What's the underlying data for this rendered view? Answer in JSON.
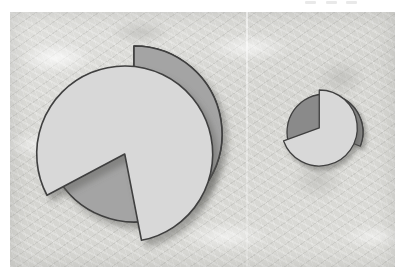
{
  "figure": {
    "title": "",
    "panel_count": 2,
    "background_texture": "mottled-paper-gray",
    "plate_color": "#d9d9d6"
  },
  "palette": {
    "slice_dark": "#8a8a8a",
    "slice_medium": "#a4a4a4",
    "slice_light": "#d8d8d8",
    "outline": "#3f3f3f",
    "shadow": "rgba(90,90,88,0.45)",
    "plate": "#d9d9d6",
    "page": "#ffffff"
  },
  "top_remnant": {
    "marks": [
      "",
      "",
      ""
    ]
  },
  "chart_data": [
    {
      "type": "pie",
      "name": "large-pie",
      "title": "",
      "xlabel": "",
      "ylabel": "",
      "center": [
        134,
        134
      ],
      "radius": 88,
      "start_angle_deg": 90,
      "direction": "clockwise",
      "legend": "none",
      "grid": false,
      "labels": [
        "Slice A",
        "Slice B",
        "Slice C"
      ],
      "values": [
        47,
        33,
        20
      ],
      "slices": [
        {
          "label": "Slice A",
          "value": 47,
          "percent": 47,
          "color": "#8a8a8a",
          "shade": "dark-gray",
          "start_deg": 90,
          "end_deg": -79,
          "exploded": false,
          "offset_px": 0
        },
        {
          "label": "Slice B",
          "value": 33,
          "percent": 33,
          "color": "#a4a4a4",
          "shade": "medium-gray",
          "start_deg": 90,
          "end_deg": 208,
          "exploded": false,
          "offset_px": 0
        },
        {
          "label": "Slice C",
          "value": 20,
          "percent": 20,
          "color": "#d8d8d8",
          "shade": "light-gray",
          "start_deg": 208,
          "end_deg": 281,
          "exploded": true,
          "offset_px": 22,
          "offset_direction_deg": 245
        }
      ]
    },
    {
      "type": "pie",
      "name": "small-pie",
      "title": "",
      "xlabel": "",
      "ylabel": "",
      "center": [
        325,
        132
      ],
      "radius": 38,
      "start_angle_deg": 90,
      "direction": "clockwise",
      "legend": "none",
      "grid": false,
      "labels": [
        "Slice A",
        "Slice B",
        "Slice C"
      ],
      "values": [
        42,
        36,
        22
      ],
      "slices": [
        {
          "label": "Slice A",
          "value": 42,
          "percent": 42,
          "color": "#8a8a8a",
          "shade": "dark-gray",
          "start_deg": 200,
          "end_deg": 338,
          "exploded": false,
          "offset_px": 0
        },
        {
          "label": "Slice B",
          "value": 36,
          "percent": 36,
          "color": "#a4a4a4",
          "shade": "medium-gray",
          "start_deg": 78,
          "end_deg": -20,
          "exploded": false,
          "offset_px": 0
        },
        {
          "label": "Slice C",
          "value": 22,
          "percent": 22,
          "color": "#d8d8d8",
          "shade": "light-gray",
          "start_deg": 90,
          "end_deg": 200,
          "exploded": true,
          "offset_px": 7,
          "offset_direction_deg": 145
        }
      ]
    }
  ]
}
